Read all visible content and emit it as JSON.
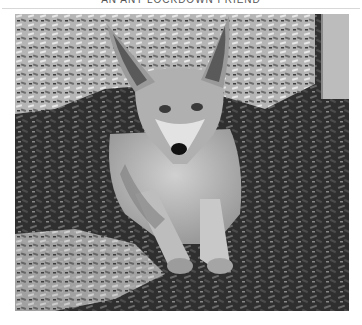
{
  "header": {
    "title": "AN ANT LOCKDOWN FRIEND"
  },
  "photo": {
    "subject": "fox lying on wood chips",
    "alt": "Black and white photo of a young fox lying on wood-chip mulch, looking at the camera",
    "colors": {
      "ground_dark": "#2a2a2a",
      "ground_light": "#bdbdbd",
      "fur": "#a8a8a8",
      "fur_light": "#d6d6d6",
      "post": "#b9b9b9",
      "nose": "#111111"
    }
  }
}
